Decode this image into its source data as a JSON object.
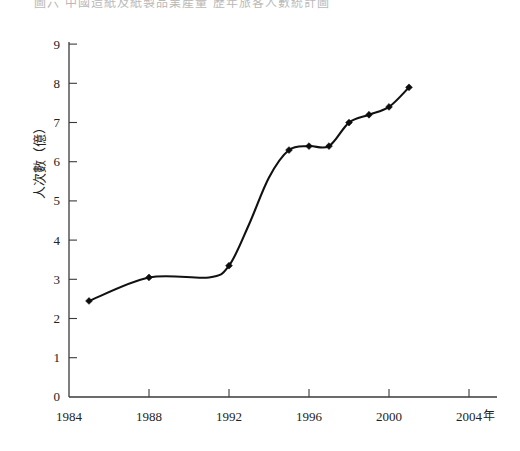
{
  "figure": {
    "caption_faded": "圖六  中國造紙及紙製品業產量  歷年旅客人數統計圖"
  },
  "chart_data": {
    "type": "line",
    "title": "",
    "xlabel": "年",
    "ylabel": "人次數（億）",
    "xlim": [
      1984,
      2005
    ],
    "ylim": [
      0,
      9
    ],
    "xticks": [
      1984,
      1988,
      1992,
      1996,
      2000,
      2004
    ],
    "xtick_labels": [
      "1984",
      "1988",
      "1992",
      "1996",
      "2000",
      "2004"
    ],
    "yticks": [
      0,
      1,
      2,
      3,
      4,
      5,
      6,
      7,
      8,
      9
    ],
    "ytick_labels": [
      "0",
      "1",
      "2",
      "3",
      "4",
      "5",
      "6",
      "7",
      "8",
      "9"
    ],
    "grid": false,
    "legend": false,
    "marker": "diamond",
    "line_color": "#111111",
    "x": [
      1985,
      1988,
      1991,
      1992,
      1993,
      1994,
      1995,
      1996,
      1997,
      1998,
      1999,
      2000,
      2001
    ],
    "values": [
      2.45,
      3.05,
      3.05,
      3.35,
      4.4,
      5.6,
      6.3,
      6.4,
      6.4,
      7.0,
      7.2,
      7.4,
      7.9
    ],
    "points": [
      {
        "x": 1985,
        "y": 2.45,
        "marker": true
      },
      {
        "x": 1988,
        "y": 3.05,
        "marker": true
      },
      {
        "x": 1991,
        "y": 3.05,
        "marker": false
      },
      {
        "x": 1992,
        "y": 3.35,
        "marker": true
      },
      {
        "x": 1993,
        "y": 4.4,
        "marker": false
      },
      {
        "x": 1994,
        "y": 5.6,
        "marker": false
      },
      {
        "x": 1995,
        "y": 6.3,
        "marker": true
      },
      {
        "x": 1996,
        "y": 6.4,
        "marker": true
      },
      {
        "x": 1997,
        "y": 6.4,
        "marker": true
      },
      {
        "x": 1998,
        "y": 7.0,
        "marker": true
      },
      {
        "x": 1999,
        "y": 7.2,
        "marker": true
      },
      {
        "x": 2000,
        "y": 7.4,
        "marker": true
      },
      {
        "x": 2001,
        "y": 7.9,
        "marker": true
      }
    ]
  },
  "axis_labels": {
    "y_axis_title": "人次數（億）",
    "x_axis_unit": "年"
  }
}
